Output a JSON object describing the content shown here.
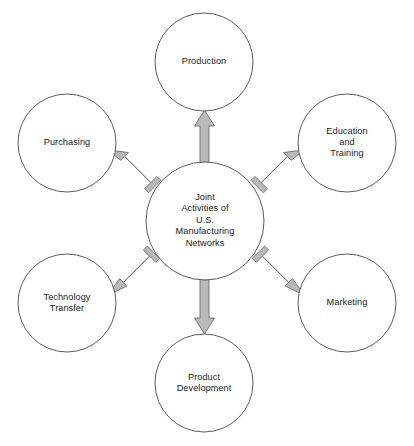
{
  "diagram": {
    "type": "hub-and-spoke radial diagram",
    "background_color": "#ffffff",
    "circle_stroke_color": "#5a5a5a",
    "arrow_fill_color": "#b9b9b9",
    "arrow_stroke_color": "#6e6e6e",
    "text_color": "#1b1b1b",
    "hub": {
      "label": "Joint\nActivities of\nU.S.\nManufacturing\nNetworks",
      "cx": 205,
      "cy": 221,
      "r": 59
    },
    "spokes": [
      {
        "id": "production",
        "label": "Production",
        "cx": 204,
        "cy": 62,
        "r": 49,
        "angle_deg": 270,
        "arrow_from": [
          205,
          162
        ],
        "arrow_to": [
          204,
          111
        ]
      },
      {
        "id": "education-and-training",
        "label": "Education\nand\nTraining",
        "cx": 347,
        "cy": 143,
        "r": 49,
        "angle_deg": 330,
        "arrow_from": [
          248,
          180
        ],
        "arrow_to": [
          303,
          151
        ]
      },
      {
        "id": "marketing",
        "label": "Marketing",
        "cx": 347,
        "cy": 303,
        "r": 49,
        "angle_deg": 30,
        "arrow_from": [
          249,
          263
        ],
        "arrow_to": [
          303,
          294
        ]
      },
      {
        "id": "product-development",
        "label": "Product\nDevelopment",
        "cx": 204,
        "cy": 383,
        "r": 49,
        "angle_deg": 90,
        "arrow_from": [
          205,
          280
        ],
        "arrow_to": [
          204,
          333
        ]
      },
      {
        "id": "technology-transfer",
        "label": "Technology\nTransfer",
        "cx": 67,
        "cy": 303,
        "r": 49,
        "angle_deg": 150,
        "arrow_from": [
          161,
          263
        ],
        "arrow_to": [
          108,
          294
        ]
      },
      {
        "id": "purchasing",
        "label": "Purchasing",
        "cx": 67,
        "cy": 143,
        "r": 49,
        "angle_deg": 210,
        "arrow_from": [
          161,
          180
        ],
        "arrow_to": [
          108,
          151
        ]
      }
    ]
  }
}
